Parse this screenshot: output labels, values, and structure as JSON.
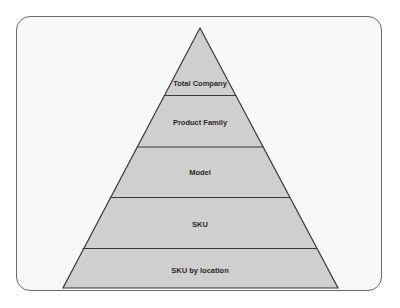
{
  "diagram": {
    "type": "pyramid",
    "levels": [
      {
        "label": "Total Company"
      },
      {
        "label": "Product Family"
      },
      {
        "label": "Model"
      },
      {
        "label": "SKU"
      },
      {
        "label": "SKU by location"
      }
    ],
    "colors": {
      "fill": "#cfcfcf",
      "stroke": "#3a3a3a",
      "frame_border": "#6a6a6a",
      "frame_fill": "#f8f8f8"
    }
  }
}
